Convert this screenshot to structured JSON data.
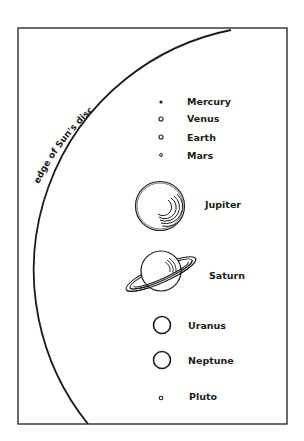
{
  "diagram": {
    "arc_label": "edge of Sun's disc",
    "planets": [
      {
        "name": "Mercury",
        "style": "dot-filled"
      },
      {
        "name": "Venus",
        "style": "dot-hollow"
      },
      {
        "name": "Earth",
        "style": "dot-hollow"
      },
      {
        "name": "Mars",
        "style": "dot-hollow-small"
      },
      {
        "name": "Jupiter",
        "style": "banded-sphere"
      },
      {
        "name": "Saturn",
        "style": "ringed-sphere"
      },
      {
        "name": "Uranus",
        "style": "crescent-sphere"
      },
      {
        "name": "Neptune",
        "style": "crescent-sphere"
      },
      {
        "name": "Pluto",
        "style": "dot-hollow"
      }
    ],
    "ink_color": "#1c1c1c",
    "background_color": "#ffffff"
  }
}
